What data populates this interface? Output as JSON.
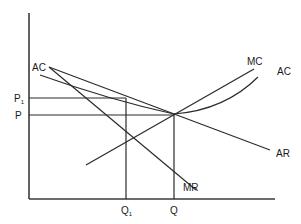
{
  "diagram": {
    "type": "monopolistic-competition-long-run",
    "axes": {
      "origin": [
        29,
        199
      ],
      "y_top": 13,
      "x_right": 275
    },
    "labels": {
      "ac_left": "AC",
      "mc": "MC",
      "ac_right": "AC",
      "ar": "AR",
      "mr": "MR",
      "p1": "P",
      "p1_sub": "1",
      "p": "P",
      "q1": "Q",
      "q1_sub": "1",
      "q": "Q"
    },
    "points": {
      "equilibrium": {
        "x": 174,
        "y": 114
      },
      "q1_x": 126,
      "q_x": 174,
      "p1_y": 98,
      "p_y": 115
    },
    "colors": {
      "line": "#2b2b2b",
      "axis": "#3a3a3a",
      "background": "#ffffff"
    }
  }
}
